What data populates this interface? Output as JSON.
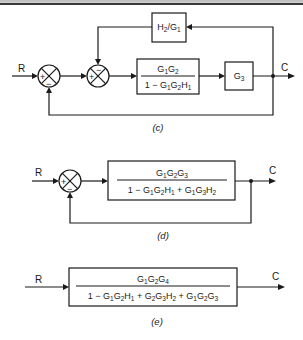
{
  "figure": {
    "header_bar": {
      "color": "#c8c8c8",
      "line_color": "#3a3a3a"
    },
    "diagrams": [
      {
        "id": "c",
        "caption": "(c)",
        "input_label": "R",
        "output_label": "C",
        "junctions": [
          {
            "name": "summing-junction-1",
            "signs": {
              "left": "+",
              "bottom": "−"
            }
          },
          {
            "name": "summing-junction-2",
            "signs": {
              "left": "+",
              "top": "−"
            }
          }
        ],
        "blocks": {
          "feedback": {
            "num": "H",
            "num_sub": "2",
            "slash": "/G",
            "den_sub": "1"
          },
          "forward_1": {
            "numerator": [
              {
                "t": "G",
                "s": "1"
              },
              {
                "t": "G",
                "s": "2"
              }
            ],
            "denominator": [
              {
                "t": "1 − G",
                "s": "1"
              },
              {
                "t": "G",
                "s": "2"
              },
              {
                "t": "H",
                "s": "1"
              }
            ]
          },
          "forward_2": {
            "t": "G",
            "s": "3"
          }
        }
      },
      {
        "id": "d",
        "caption": "(d)",
        "input_label": "R",
        "output_label": "C",
        "junctions": [
          {
            "name": "summing-junction",
            "signs": {
              "left": "+",
              "bottom": "−"
            }
          }
        ],
        "blocks": {
          "forward": {
            "numerator": [
              {
                "t": "G",
                "s": "1"
              },
              {
                "t": "G",
                "s": "2"
              },
              {
                "t": "G",
                "s": "3"
              }
            ],
            "denominator": [
              {
                "t": "1 − G",
                "s": "1"
              },
              {
                "t": "G",
                "s": "2"
              },
              {
                "t": "H",
                "s": "1"
              },
              {
                "t": " + G",
                "s": "1"
              },
              {
                "t": "G",
                "s": "3"
              },
              {
                "t": "H",
                "s": "2"
              }
            ]
          }
        }
      },
      {
        "id": "e",
        "caption": "(e)",
        "input_label": "R",
        "output_label": "C",
        "blocks": {
          "overall": {
            "numerator": [
              {
                "t": "G",
                "s": "1"
              },
              {
                "t": "G",
                "s": "2"
              },
              {
                "t": "G",
                "s": "4"
              }
            ],
            "denominator": [
              {
                "t": "1 − G",
                "s": "1"
              },
              {
                "t": "G",
                "s": "2"
              },
              {
                "t": "H",
                "s": "1"
              },
              {
                "t": " + G",
                "s": "2"
              },
              {
                "t": "G",
                "s": "3"
              },
              {
                "t": "H",
                "s": "2"
              },
              {
                "t": " + G",
                "s": "1"
              },
              {
                "t": "G",
                "s": "2"
              },
              {
                "t": "G",
                "s": "3"
              }
            ]
          }
        }
      }
    ]
  }
}
